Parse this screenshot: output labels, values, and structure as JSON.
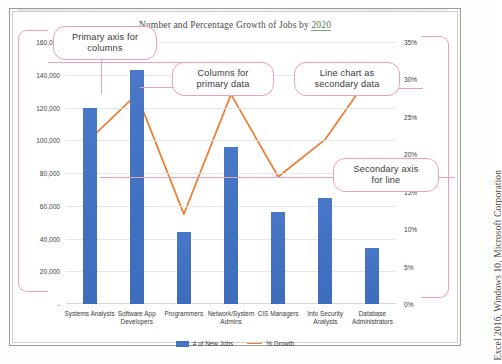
{
  "figure": {
    "side_caption": "Excel 2016, Windows 10, Microsoft Corporation"
  },
  "chart_data": {
    "type": "bar",
    "title": "Number and Percentage Growth of Jobs by 2020",
    "title_prefix": "Number and Percentage Growth of Jobs by ",
    "title_year": "2020",
    "xlabel": "",
    "ylabel": "",
    "categories": [
      "Systems Analysts",
      "Software App Developers",
      "Programmers",
      "Network/System Admins",
      "CIS Managers",
      "Info Security Analysts",
      "Database Administrators"
    ],
    "category_lines": [
      [
        "Systems Analysts"
      ],
      [
        "Software App",
        "Developers"
      ],
      [
        "Programmers"
      ],
      [
        "Network/System",
        "Admins"
      ],
      [
        "CIS Managers"
      ],
      [
        "Info Security",
        "Analysts"
      ],
      [
        "Database",
        "Administrators"
      ]
    ],
    "series": [
      {
        "name": "# of New Jobs",
        "type": "bar",
        "axis": "primary",
        "color": "#4472C4",
        "values": [
          120000,
          143000,
          44000,
          96000,
          56000,
          65000,
          34000
        ]
      },
      {
        "name": "% Growth",
        "type": "line",
        "axis": "secondary",
        "color": "#ED7D31",
        "values": [
          22,
          28,
          12,
          28,
          17,
          22,
          31
        ]
      }
    ],
    "primary_axis": {
      "ticks": [
        "-",
        "20,000",
        "40,000",
        "60,000",
        "80,000",
        "100,000",
        "120,000",
        "140,000",
        "160,000"
      ],
      "tick_values": [
        0,
        20000,
        40000,
        60000,
        80000,
        100000,
        120000,
        140000,
        160000
      ],
      "ylim": [
        0,
        160000
      ]
    },
    "secondary_axis": {
      "ticks": [
        "0%",
        "5%",
        "10%",
        "15%",
        "20%",
        "25%",
        "30%",
        "35%"
      ],
      "tick_values": [
        0,
        5,
        10,
        15,
        20,
        25,
        30,
        35
      ],
      "ylim": [
        0,
        35
      ]
    },
    "grid": true,
    "legend": {
      "position": "bottom",
      "entries": [
        {
          "label": "# of New Jobs",
          "marker": "bar",
          "color": "#4472C4"
        },
        {
          "label": "% Growth",
          "marker": "line",
          "color": "#ED7D31"
        }
      ]
    }
  },
  "annotations": {
    "accent_color": "#E8A0BE",
    "callouts": [
      {
        "id": "primary-axis",
        "text": "Primary axis for columns",
        "line1": "Primary axis for",
        "line2": "columns"
      },
      {
        "id": "columns-primary",
        "text": "Columns for primary data",
        "line1": "Columns for",
        "line2": "primary data"
      },
      {
        "id": "line-secondary",
        "text": "Line chart as secondary data",
        "line1": "Line chart as",
        "line2": "secondary data"
      },
      {
        "id": "secondary-axis",
        "text": "Secondary axis for line",
        "line1": "Secondary axis",
        "line2": "for line"
      }
    ]
  }
}
